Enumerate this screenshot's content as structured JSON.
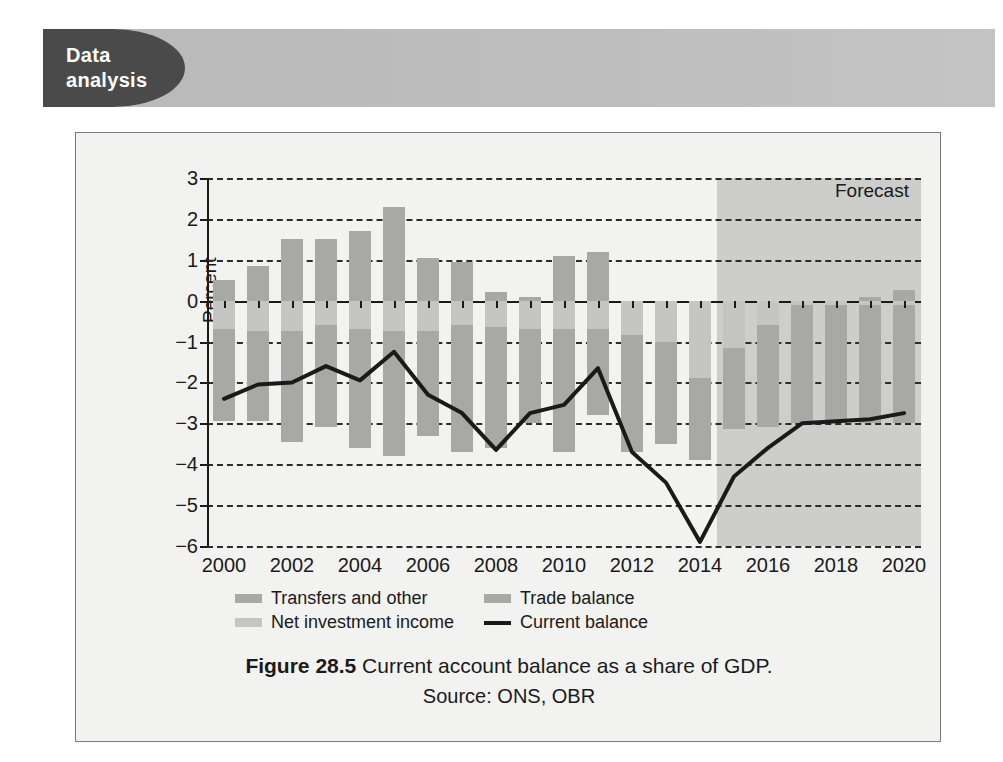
{
  "banner": {
    "tab_line1": "Data",
    "tab_line2": "analysis"
  },
  "caption": {
    "figure_number": "Figure 28.5",
    "text": "Current account balance as a share of GDP.",
    "source": "Source: ONS, OBR"
  },
  "chart_data": {
    "type": "bar",
    "title": "Current account balance as a share of GDP.",
    "xlabel": "",
    "ylabel": "Percent",
    "ylim": [
      -6,
      3
    ],
    "ytick_labels": [
      "3",
      "2",
      "1",
      "0",
      "−1",
      "−2",
      "−3",
      "−4",
      "−5",
      "−6"
    ],
    "yticks": [
      3,
      2,
      1,
      0,
      -1,
      -2,
      -3,
      -4,
      -5,
      -6
    ],
    "grid": true,
    "legend_position": "below-left",
    "annotations": [
      {
        "text": "Forecast",
        "from_x": 2014.5,
        "to_x": 2020.5
      }
    ],
    "x": [
      2000,
      2001,
      2002,
      2003,
      2004,
      2005,
      2006,
      2007,
      2008,
      2009,
      2010,
      2011,
      2012,
      2013,
      2014,
      2015,
      2016,
      2017,
      2018,
      2019,
      2020
    ],
    "xtick_labels": [
      "2000",
      "2002",
      "2004",
      "2006",
      "2008",
      "2010",
      "2012",
      "2014",
      "2016",
      "2018",
      "2020"
    ],
    "xticks": [
      2000,
      2002,
      2004,
      2006,
      2008,
      2010,
      2012,
      2014,
      2016,
      2018,
      2020
    ],
    "series": [
      {
        "name": "Transfers and other",
        "type": "bar",
        "stack": "positive",
        "color": "#a8a8a6",
        "values": [
          0.5,
          0.85,
          1.5,
          1.5,
          1.7,
          2.3,
          1.05,
          0.95,
          0.2,
          0.1,
          1.1,
          1.2,
          0.0,
          0.0,
          0.0,
          0.0,
          0.0,
          0.0,
          0.0,
          0.1,
          0.25
        ]
      },
      {
        "name": "Net investment income",
        "type": "bar",
        "stack": "negative",
        "color": "#c5c5c3",
        "values": [
          -0.7,
          -0.75,
          -0.75,
          -0.6,
          -0.7,
          -0.75,
          -0.75,
          -0.6,
          -0.65,
          -0.7,
          -0.7,
          -0.7,
          -0.85,
          -1.0,
          -1.9,
          -1.15,
          -0.6,
          -0.1,
          -0.1,
          -0.1,
          -0.1
        ]
      },
      {
        "name": "Trade balance",
        "type": "bar",
        "stack": "negative",
        "color": "#a8a8a6",
        "values": [
          -2.25,
          -2.2,
          -2.7,
          -2.5,
          -2.9,
          -3.05,
          -2.55,
          -3.1,
          -2.95,
          -2.3,
          -3.0,
          -2.1,
          -2.85,
          -2.5,
          -2.0,
          -2.0,
          -2.5,
          -2.9,
          -2.9,
          -2.9,
          -2.9
        ]
      },
      {
        "name": "Current balance",
        "type": "line",
        "color": "#1a1a1a",
        "values": [
          -2.4,
          -2.05,
          -2.0,
          -1.6,
          -1.95,
          -1.25,
          -2.3,
          -2.75,
          -3.65,
          -2.75,
          -2.55,
          -1.65,
          -3.7,
          -4.45,
          -5.9,
          -4.3,
          -3.6,
          -3.0,
          -2.95,
          -2.9,
          -2.75
        ]
      }
    ]
  },
  "legend": {
    "items": [
      {
        "label": "Transfers and other",
        "swatch": "transfers"
      },
      {
        "label": "Trade balance",
        "swatch": "trade"
      },
      {
        "label": "Net investment income",
        "swatch": "nii"
      },
      {
        "label": "Current balance",
        "swatch": "line"
      }
    ]
  }
}
